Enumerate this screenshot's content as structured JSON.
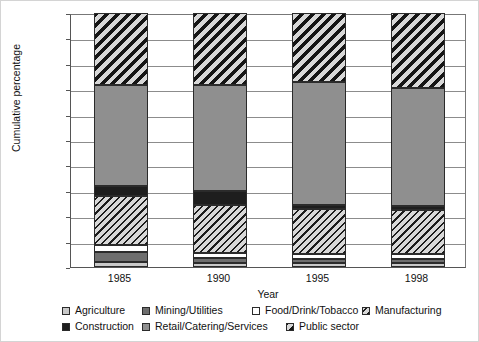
{
  "chart_data": {
    "type": "bar",
    "subtype": "stacked-percentage",
    "title": "",
    "xlabel": "Year",
    "ylabel": "Cumulative percentage",
    "categories": [
      "1985",
      "1990",
      "1995",
      "1998"
    ],
    "ylim": [
      0,
      100
    ],
    "ytick_labels": [
      "0%",
      "10%",
      "20%",
      "30%",
      "40%",
      "50%",
      "60%",
      "70%",
      "80%",
      "90%",
      "100%"
    ],
    "ytick_values": [
      0,
      10,
      20,
      30,
      40,
      50,
      60,
      70,
      80,
      90,
      100
    ],
    "grid": true,
    "legend_position": "bottom",
    "series": [
      {
        "name": "Agriculture",
        "swatch": "light-gray",
        "color": "#c9c9c9",
        "values": [
          2.0,
          1.5,
          1.5,
          1.5
        ]
      },
      {
        "name": "Mining/Utilities",
        "swatch": "medium-gray",
        "color": "#6e6e6e",
        "values": [
          4.0,
          2.0,
          1.5,
          1.5
        ]
      },
      {
        "name": "Food/Drink/Tobacco",
        "swatch": "white",
        "color": "#ffffff",
        "values": [
          2.5,
          2.0,
          2.0,
          2.0
        ]
      },
      {
        "name": "Manufacturing",
        "swatch": "hatched-fine",
        "color": "#d8d8d8",
        "values": [
          19.5,
          19.0,
          18.0,
          17.5
        ]
      },
      {
        "name": "Construction",
        "swatch": "black",
        "color": "#1e1e1e",
        "values": [
          4.0,
          5.5,
          1.5,
          1.5
        ]
      },
      {
        "name": "Retail/Catering/Services",
        "swatch": "gray",
        "color": "#8f8f8f",
        "values": [
          39.5,
          41.5,
          48.5,
          46.5
        ]
      },
      {
        "name": "Public sector",
        "swatch": "hatched-bold",
        "color": "#d8d8d8",
        "values": [
          28.5,
          28.5,
          27.0,
          29.5
        ]
      }
    ],
    "cumulative_tops": {
      "1985": [
        2.0,
        6.0,
        8.5,
        28.0,
        32.0,
        71.5,
        100.0
      ],
      "1990": [
        1.5,
        3.5,
        5.5,
        24.5,
        30.0,
        71.5,
        100.0
      ],
      "1995": [
        1.5,
        3.0,
        5.0,
        23.0,
        24.5,
        73.0,
        100.0
      ],
      "1998": [
        1.5,
        3.0,
        5.0,
        22.5,
        24.0,
        70.5,
        100.0
      ]
    }
  },
  "legend": {
    "row1": [
      {
        "label": "Agriculture",
        "swatch": "legend-swatch-agriculture"
      },
      {
        "label": "Mining/Utilities",
        "swatch": "legend-swatch-mining"
      },
      {
        "label": "Food/Drink/Tobacco",
        "swatch": "legend-swatch-food"
      },
      {
        "label": "Manufacturing",
        "swatch": "legend-swatch-manufacturing"
      }
    ],
    "row2": [
      {
        "label": "Construction",
        "swatch": "legend-swatch-construction"
      },
      {
        "label": "Retail/Catering/Services",
        "swatch": "legend-swatch-retail"
      },
      {
        "label": "Public sector",
        "swatch": "legend-swatch-public"
      }
    ]
  }
}
